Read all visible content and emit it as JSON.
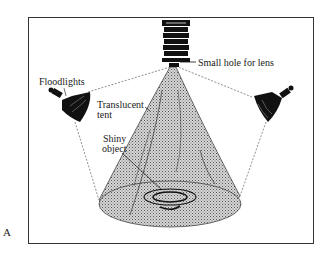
{
  "figure": {
    "letter": "A",
    "labels": {
      "hole": "Small hole for lens",
      "floodlights": "Floodlights",
      "tent_line1": "Translucent",
      "tent_line2": "tent",
      "object_line1": "Shiny",
      "object_line2": "object"
    }
  },
  "colors": {
    "ink": "#111111",
    "frame": "#333333",
    "tent_fill": "#bdbdbd",
    "background": "#ffffff"
  }
}
